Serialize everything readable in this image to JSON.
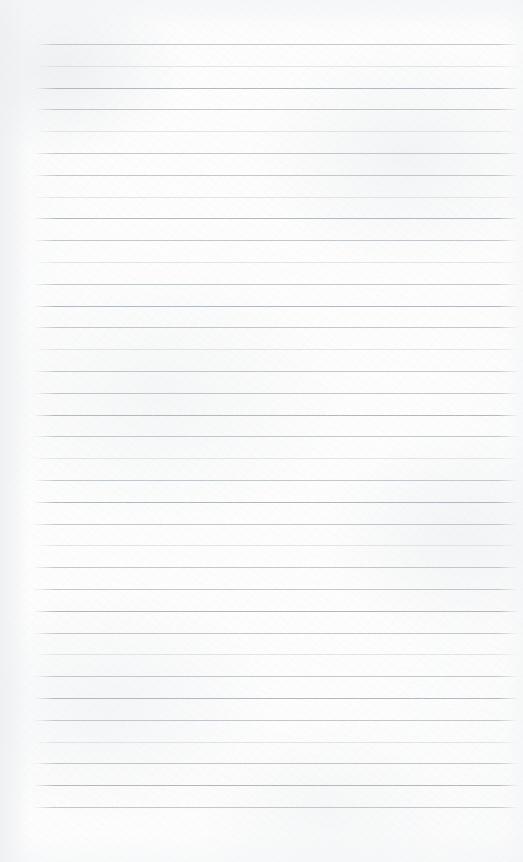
{
  "document": {
    "type": "lined-notebook-paper",
    "title": "Blank ruled notebook page",
    "content_text": "",
    "is_blank": true,
    "written_content": []
  },
  "page": {
    "width": 523,
    "height": 862,
    "paper_color": "#fdfdfd",
    "background_tint": "#f6f7f8",
    "orientation": "portrait"
  },
  "ruling": {
    "style": "wide-ruled horizontal lines",
    "line_color": "#b9bec4",
    "line_color_faint": "#c5cace",
    "line_color_strong": "#aeb4ba",
    "line_thickness_px": 1,
    "line_count": 36,
    "first_line_y": 44,
    "line_spacing_px": 21.8,
    "line_left_x": 33,
    "line_right_x": 520,
    "has_vertical_margin_line": false,
    "margin_top_px": 44,
    "margin_bottom_px": 54,
    "weights": [
      "normal",
      "faint",
      "strong",
      "normal",
      "faint",
      "normal",
      "normal",
      "faint",
      "strong",
      "normal",
      "faint",
      "normal",
      "strong",
      "normal",
      "faint",
      "normal",
      "normal",
      "strong",
      "normal",
      "faint",
      "normal",
      "strong",
      "normal",
      "faint",
      "normal",
      "normal",
      "strong",
      "normal",
      "faint",
      "normal",
      "strong",
      "normal",
      "faint",
      "normal",
      "strong",
      "normal"
    ]
  },
  "annotations": {
    "header_area_label": "",
    "footer_area_label": ""
  }
}
